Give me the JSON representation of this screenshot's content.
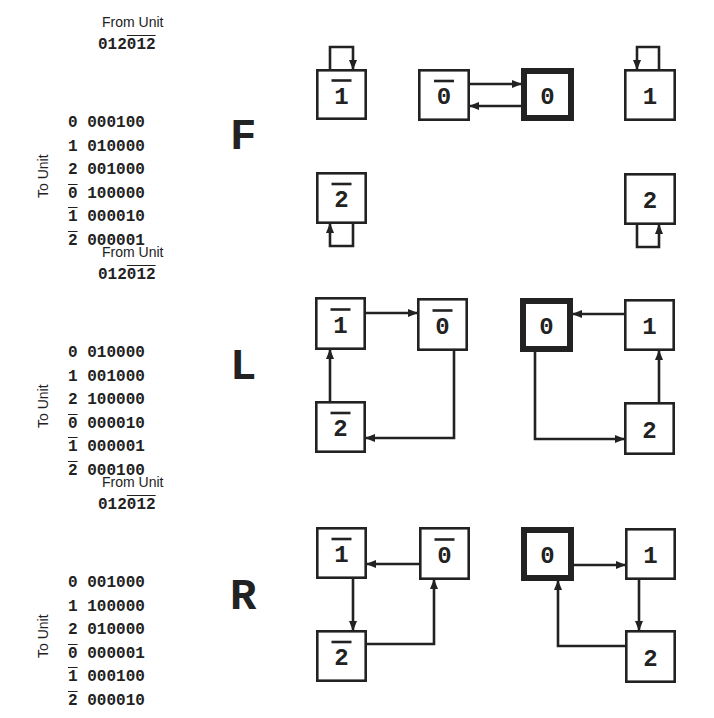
{
  "unit_labels": [
    "0",
    "1",
    "2",
    "0̄",
    "1̄",
    "2̄"
  ],
  "from_label": "From Unit",
  "to_label": "To Unit",
  "colors": {
    "ink": "#222222",
    "background": "#ffffff"
  },
  "panels": [
    {
      "operator": "F",
      "top": 0,
      "from_digits": "012",
      "from_digits_bar": "012",
      "matrix": [
        {
          "unit": "0",
          "bar": false,
          "bits": "000100"
        },
        {
          "unit": "1",
          "bar": false,
          "bits": "010000"
        },
        {
          "unit": "2",
          "bar": false,
          "bits": "001000"
        },
        {
          "unit": "0",
          "bar": true,
          "bits": "100000"
        },
        {
          "unit": "1",
          "bar": true,
          "bits": "000010"
        },
        {
          "unit": "2",
          "bar": true,
          "bits": "000001"
        }
      ],
      "boxes": [
        {
          "id": "1b",
          "label": "1",
          "bar": true,
          "x": 316,
          "y": 69,
          "w": 51,
          "h": 51,
          "bold": false
        },
        {
          "id": "0b",
          "label": "0",
          "bar": true,
          "x": 418,
          "y": 69,
          "w": 52,
          "h": 52,
          "bold": false
        },
        {
          "id": "0",
          "label": "0",
          "bar": false,
          "x": 521,
          "y": 68,
          "w": 53,
          "h": 53,
          "bold": true
        },
        {
          "id": "1",
          "label": "1",
          "bar": false,
          "x": 624,
          "y": 69,
          "w": 52,
          "h": 52,
          "bold": false
        },
        {
          "id": "2b",
          "label": "2",
          "bar": true,
          "x": 316,
          "y": 172,
          "w": 51,
          "h": 52,
          "bold": false
        },
        {
          "id": "2",
          "label": "2",
          "bar": false,
          "x": 624,
          "y": 173,
          "w": 52,
          "h": 52,
          "bold": false
        }
      ],
      "arrows": [
        {
          "from": "1b",
          "to": "1b",
          "points": [
            [
              330,
              69
            ],
            [
              330,
              47
            ],
            [
              353,
              47
            ],
            [
              353,
              69
            ]
          ]
        },
        {
          "from": "0b",
          "to": "0",
          "points": [
            [
              470,
              84
            ],
            [
              521,
              84
            ]
          ]
        },
        {
          "from": "0",
          "to": "0b",
          "points": [
            [
              521,
              106
            ],
            [
              470,
              106
            ]
          ]
        },
        {
          "from": "1",
          "to": "1",
          "points": [
            [
              659,
              69
            ],
            [
              659,
              47
            ],
            [
              637,
              47
            ],
            [
              637,
              69
            ]
          ]
        },
        {
          "from": "2b",
          "to": "2b",
          "points": [
            [
              353,
              224
            ],
            [
              353,
              246
            ],
            [
              330,
              246
            ],
            [
              330,
              224
            ]
          ]
        },
        {
          "from": "2",
          "to": "2",
          "points": [
            [
              637,
              225
            ],
            [
              637,
              247
            ],
            [
              659,
              247
            ],
            [
              659,
              225
            ]
          ]
        }
      ]
    },
    {
      "operator": "L",
      "top": 230,
      "from_digits": "012",
      "from_digits_bar": "012",
      "matrix": [
        {
          "unit": "0",
          "bar": false,
          "bits": "010000"
        },
        {
          "unit": "1",
          "bar": false,
          "bits": "001000"
        },
        {
          "unit": "2",
          "bar": false,
          "bits": "100000"
        },
        {
          "unit": "0",
          "bar": true,
          "bits": "000010"
        },
        {
          "unit": "1",
          "bar": true,
          "bits": "000001"
        },
        {
          "unit": "2",
          "bar": true,
          "bits": "000100"
        }
      ],
      "boxes": [
        {
          "id": "1b",
          "label": "1",
          "bar": true,
          "x": 315,
          "y": 297,
          "w": 51,
          "h": 53,
          "bold": false
        },
        {
          "id": "0b",
          "label": "0",
          "bar": true,
          "x": 417,
          "y": 298,
          "w": 51,
          "h": 53,
          "bold": false
        },
        {
          "id": "2b",
          "label": "2",
          "bar": true,
          "x": 315,
          "y": 401,
          "w": 51,
          "h": 52,
          "bold": false
        },
        {
          "id": "0",
          "label": "0",
          "bar": false,
          "x": 520,
          "y": 298,
          "w": 53,
          "h": 54,
          "bold": true
        },
        {
          "id": "1",
          "label": "1",
          "bar": false,
          "x": 624,
          "y": 299,
          "w": 51,
          "h": 52,
          "bold": false
        },
        {
          "id": "2",
          "label": "2",
          "bar": false,
          "x": 624,
          "y": 402,
          "w": 51,
          "h": 53,
          "bold": false
        }
      ],
      "arrows": [
        {
          "from": "1b",
          "to": "0b",
          "points": [
            [
              366,
              313
            ],
            [
              417,
              313
            ]
          ]
        },
        {
          "from": "2b",
          "to": "1b",
          "points": [
            [
              330,
              401
            ],
            [
              330,
              350
            ]
          ]
        },
        {
          "from": "0b",
          "to": "2b",
          "points": [
            [
              454,
              351
            ],
            [
              454,
              438
            ],
            [
              366,
              438
            ]
          ]
        },
        {
          "from": "1",
          "to": "0",
          "points": [
            [
              624,
              314
            ],
            [
              573,
              314
            ]
          ]
        },
        {
          "from": "2",
          "to": "1",
          "points": [
            [
              659,
              402
            ],
            [
              659,
              351
            ]
          ]
        },
        {
          "from": "0",
          "to": "2",
          "points": [
            [
              535,
              352
            ],
            [
              535,
              439
            ],
            [
              624,
              439
            ]
          ]
        }
      ]
    },
    {
      "operator": "R",
      "top": 460,
      "from_digits": "012",
      "from_digits_bar": "012",
      "matrix": [
        {
          "unit": "0",
          "bar": false,
          "bits": "001000"
        },
        {
          "unit": "1",
          "bar": false,
          "bits": "100000"
        },
        {
          "unit": "2",
          "bar": false,
          "bits": "010000"
        },
        {
          "unit": "0",
          "bar": true,
          "bits": "000001"
        },
        {
          "unit": "1",
          "bar": true,
          "bits": "000100"
        },
        {
          "unit": "2",
          "bar": true,
          "bits": "000010"
        }
      ],
      "boxes": [
        {
          "id": "1b",
          "label": "1",
          "bar": true,
          "x": 316,
          "y": 527,
          "w": 51,
          "h": 52,
          "bold": false
        },
        {
          "id": "0b",
          "label": "0",
          "bar": true,
          "x": 419,
          "y": 527,
          "w": 51,
          "h": 53,
          "bold": false
        },
        {
          "id": "2b",
          "label": "2",
          "bar": true,
          "x": 316,
          "y": 630,
          "w": 51,
          "h": 52,
          "bold": false
        },
        {
          "id": "0",
          "label": "0",
          "bar": false,
          "x": 521,
          "y": 527,
          "w": 53,
          "h": 54,
          "bold": true
        },
        {
          "id": "1",
          "label": "1",
          "bar": false,
          "x": 625,
          "y": 528,
          "w": 51,
          "h": 52,
          "bold": false
        },
        {
          "id": "2",
          "label": "2",
          "bar": false,
          "x": 625,
          "y": 630,
          "w": 51,
          "h": 53,
          "bold": false
        }
      ],
      "arrows": [
        {
          "from": "0b",
          "to": "1b",
          "points": [
            [
              419,
              564
            ],
            [
              367,
              564
            ]
          ]
        },
        {
          "from": "1b",
          "to": "2b",
          "points": [
            [
              353,
              579
            ],
            [
              353,
              630
            ]
          ]
        },
        {
          "from": "2b",
          "to": "0b",
          "points": [
            [
              367,
              644
            ],
            [
              434,
              644
            ],
            [
              434,
              580
            ]
          ]
        },
        {
          "from": "0",
          "to": "1",
          "points": [
            [
              574,
              565
            ],
            [
              625,
              565
            ]
          ]
        },
        {
          "from": "1",
          "to": "2",
          "points": [
            [
              639,
              580
            ],
            [
              639,
              630
            ]
          ]
        },
        {
          "from": "2",
          "to": "0",
          "points": [
            [
              625,
              646
            ],
            [
              558,
              646
            ],
            [
              558,
              581
            ]
          ]
        }
      ]
    }
  ]
}
